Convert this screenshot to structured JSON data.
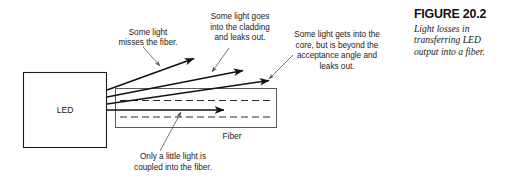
{
  "figure": {
    "caption_title": "FIGURE 20.2",
    "caption_body": "Light losses in transferring LED output into a fiber.",
    "source_label": "LED",
    "fiber_label": "Fiber"
  },
  "annotations": [
    {
      "id": "misses-fiber",
      "lines": [
        "Some light",
        "misses the fiber."
      ],
      "text_x": 148,
      "text_y": 36,
      "leader": {
        "x1": 143,
        "y1": 47,
        "x2": 160,
        "y2": 66
      },
      "arrow": true
    },
    {
      "id": "cladding-leak",
      "lines": [
        "Some light goes",
        "into the cladding",
        "and leaks out."
      ],
      "text_x": 240,
      "text_y": 27,
      "leader": {
        "x1": 229,
        "y1": 47,
        "x2": 212,
        "y2": 73
      },
      "arrow": true
    },
    {
      "id": "beyond-acceptance-angle",
      "lines": [
        "Some light gets into the",
        "core, but is beyond the",
        "acceptance angle and",
        "leaks out."
      ],
      "text_x": 337,
      "text_y": 41,
      "leader": {
        "x1": 292,
        "y1": 54,
        "x2": 268,
        "y2": 80
      },
      "arrow": true
    },
    {
      "id": "coupled-into-fiber",
      "lines": [
        "Only a little light is",
        "coupled into the fiber."
      ],
      "text_x": 173,
      "text_y": 161,
      "leader": {
        "x1": 160,
        "y1": 152,
        "x2": 181,
        "y2": 111
      },
      "arrow": true
    }
  ],
  "rays": [
    {
      "id": "ray-misses-fiber",
      "x1": 107,
      "y1": 90,
      "x2": 196,
      "y2": 58
    },
    {
      "id": "ray-into-cladding",
      "x1": 107,
      "y1": 97,
      "x2": 245,
      "y2": 70
    },
    {
      "id": "ray-beyond-angle",
      "x1": 107,
      "y1": 104,
      "x2": 271,
      "y2": 80
    },
    {
      "id": "ray-coupled",
      "x1": 107,
      "y1": 110,
      "x2": 226,
      "y2": 110
    }
  ],
  "shapes": {
    "led_box": {
      "x": 23,
      "y": 72,
      "width": 84,
      "height": 76
    },
    "fiber_box": {
      "x": 115,
      "y": 88,
      "width": 162,
      "height": 40
    },
    "core_top_y": 100,
    "core_bottom_y": 117
  },
  "colors": {
    "ink": "#111111",
    "rule": "#5a5a5a",
    "background": "#ffffff"
  }
}
